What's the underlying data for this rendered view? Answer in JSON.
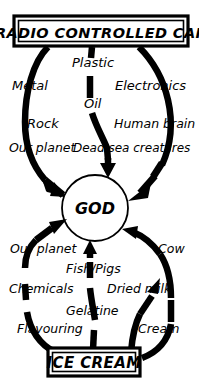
{
  "canvas": {
    "width": 199,
    "height": 391,
    "background_color": "#ffffff",
    "ink_color": "#000000"
  },
  "nodes": {
    "top_box": {
      "label": "RADIO CONTROLLED  CAR",
      "shape": "rectangle",
      "x": 14,
      "y": 16,
      "width": 174,
      "height": 30
    },
    "center_circle": {
      "label": "GOD",
      "shape": "circle",
      "cx": 95,
      "cy": 208,
      "r": 33
    },
    "bottom_box": {
      "label": "ICE CREAM",
      "shape": "rectangle",
      "x": 48,
      "y": 348,
      "width": 92,
      "height": 28
    }
  },
  "edge_labels": {
    "upper": [
      {
        "text": "Plastic",
        "x": 72,
        "y": 67
      },
      {
        "text": "Metal",
        "x": 12,
        "y": 90
      },
      {
        "text": "Electronics",
        "x": 117,
        "y": 90
      },
      {
        "text": "Oil",
        "x": 85,
        "y": 107
      },
      {
        "text": "Rock",
        "x": 27,
        "y": 128
      },
      {
        "text": "Human brain",
        "x": 116,
        "y": 128
      },
      {
        "text": "Our planet",
        "x": 12,
        "y": 152
      },
      {
        "text": "Dead sea creatures",
        "x": 76,
        "y": 152
      }
    ],
    "lower": [
      {
        "text": "Our planet",
        "x": 14,
        "y": 253
      },
      {
        "text": "Cow",
        "x": 159,
        "y": 253
      },
      {
        "text": "Fish/Pigs",
        "x": 70,
        "y": 272
      },
      {
        "text": "Chemicals",
        "x": 12,
        "y": 292
      },
      {
        "text": "Dried milk",
        "x": 108,
        "y": 292
      },
      {
        "text": "Gelatine",
        "x": 68,
        "y": 314
      },
      {
        "text": "Flavouring",
        "x": 20,
        "y": 332
      },
      {
        "text": "Cream",
        "x": 139,
        "y": 332
      }
    ]
  },
  "arrows": {
    "from_top_box": [
      "left-metal-rock-our-planet",
      "center-plastic-oil-dead-sea-creatures",
      "right-electronics-human-brain"
    ],
    "from_bottom_box": [
      "left-our-planet-chemicals-flavouring",
      "center-fish-pigs-gelatine",
      "right-dried-milk",
      "right-cow-cream"
    ],
    "direction": "toward-center"
  },
  "meta": {
    "title": "RADIO CONTROLLED  CAR",
    "center": "GOD",
    "footer": "ICE CREAM"
  }
}
